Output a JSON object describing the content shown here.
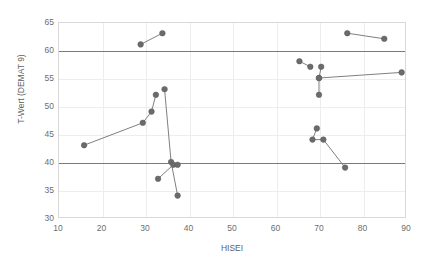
{
  "chart_data": {
    "type": "scatter",
    "title": "",
    "xlabel": "HISEI",
    "ylabel": "T-Wert (DEMAT 9)",
    "xlim": [
      10,
      90
    ],
    "ylim": [
      30,
      65
    ],
    "xticks": [
      10,
      20,
      30,
      40,
      50,
      60,
      70,
      80,
      90
    ],
    "yticks": [
      30,
      35,
      40,
      45,
      50,
      55,
      60,
      65
    ],
    "grid": true,
    "legend": "none",
    "reference_lines": [
      {
        "name": "upper-reference-line",
        "y": 60,
        "orientation": "horizontal",
        "color": "#7a7a7a"
      },
      {
        "name": "lower-reference-line",
        "y": 40,
        "orientation": "horizontal",
        "color": "#7a7a7a"
      }
    ],
    "point_color": "#6b6b6b",
    "connector_color": "#808080",
    "series": [
      {
        "name": "group-1",
        "points": [
          [
            16,
            43
          ],
          [
            29.5,
            47
          ],
          [
            31.5,
            49
          ],
          [
            32.5,
            52
          ]
        ]
      },
      {
        "name": "group-2",
        "points": [
          [
            29,
            61
          ],
          [
            34,
            63
          ]
        ]
      },
      {
        "name": "group-3",
        "points": [
          [
            34.5,
            53
          ],
          [
            36,
            40
          ],
          [
            37.5,
            34
          ]
        ]
      },
      {
        "name": "group-4",
        "points": [
          [
            33,
            37
          ],
          [
            36.5,
            39.5
          ],
          [
            37.5,
            39.5
          ]
        ]
      },
      {
        "name": "group-5",
        "points": [
          [
            65.5,
            58
          ],
          [
            68,
            57
          ]
        ]
      },
      {
        "name": "group-6",
        "points": [
          [
            70.5,
            57
          ],
          [
            70,
            55
          ],
          [
            70,
            52
          ]
        ]
      },
      {
        "name": "group-7",
        "points": [
          [
            70,
            55
          ],
          [
            89,
            56
          ]
        ]
      },
      {
        "name": "group-8",
        "points": [
          [
            69.5,
            46
          ],
          [
            68.5,
            44
          ],
          [
            71,
            44
          ],
          [
            76,
            39
          ]
        ]
      },
      {
        "name": "group-9",
        "points": [
          [
            76.5,
            63
          ],
          [
            85,
            62
          ]
        ]
      }
    ]
  },
  "axis": {
    "x_label": "HISEI",
    "y_label": "T-Wert (DEMAT 9)",
    "x_tick_labels": [
      "10",
      "20",
      "30",
      "40",
      "50",
      "60",
      "70",
      "80",
      "90"
    ],
    "y_tick_labels": [
      "30",
      "35",
      "40",
      "45",
      "50",
      "55",
      "60",
      "65"
    ]
  }
}
